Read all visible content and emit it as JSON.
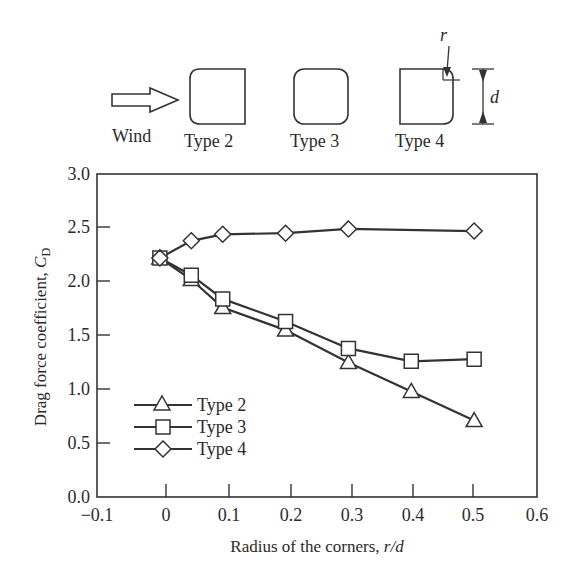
{
  "diagram": {
    "wind_label": "Wind",
    "types": [
      {
        "label": "Type 2",
        "rounded": "windward"
      },
      {
        "label": "Type 3",
        "rounded": "all"
      },
      {
        "label": "Type 4",
        "rounded": "leeward"
      }
    ],
    "radius_symbol": "r",
    "depth_symbol": "d"
  },
  "chart_data": {
    "type": "line",
    "title": "",
    "xlabel": "Radius of the corners, r/d",
    "ylabel": "Drag force coefficient, C_D",
    "xlim": [
      -0.1,
      0.6
    ],
    "ylim": [
      0.0,
      3.0
    ],
    "xticks": [
      "-0.1",
      "0",
      "0.1",
      "0.2",
      "0.3",
      "0.4",
      "0.5",
      "0.6"
    ],
    "yticks": [
      "0.0",
      "0.5",
      "1.0",
      "1.5",
      "2.0",
      "2.5",
      "3.0"
    ],
    "grid": false,
    "legend_position": "lower left",
    "x": [
      0,
      0.05,
      0.1,
      0.2,
      0.3,
      0.4,
      0.5
    ],
    "series": [
      {
        "name": "Type 2",
        "marker": "triangle",
        "values": [
          2.22,
          2.02,
          1.76,
          1.55,
          1.25,
          0.98,
          0.71
        ]
      },
      {
        "name": "Type 3",
        "marker": "square",
        "values": [
          2.22,
          2.06,
          1.84,
          1.63,
          1.38,
          1.26,
          1.28
        ]
      },
      {
        "name": "Type 4",
        "marker": "diamond",
        "values": [
          2.22,
          2.38,
          2.44,
          2.45,
          2.49,
          null,
          2.47
        ]
      }
    ]
  },
  "labels": {
    "xlabel_main": "Radius of the corners, ",
    "xlabel_ital": "r/d",
    "ylabel_main": "Drag force coefficient, ",
    "ylabel_ital": "C",
    "ylabel_sub": "D"
  }
}
